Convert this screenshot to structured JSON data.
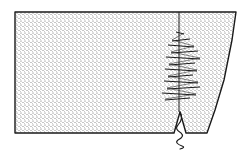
{
  "figure": {
    "description": "Stippled fabric piece with a vertical seam joined by hand zigzag/overcast stitches; a loose thread tail hangs from a notch at the bottom edge",
    "colors": {
      "background": "#ffffff",
      "ink": "#1a1a1a",
      "stipple": "#555555"
    },
    "fabric": {
      "outline": [
        [
          15,
          12
        ],
        [
          236,
          12
        ],
        [
          232,
          40
        ],
        [
          224,
          80
        ],
        [
          215,
          110
        ],
        [
          207,
          133
        ],
        [
          186,
          133
        ],
        [
          180,
          112
        ],
        [
          174,
          133
        ],
        [
          15,
          133
        ]
      ]
    },
    "seam": {
      "x": 179,
      "top": 12,
      "bottom": 112
    },
    "stitches": [
      {
        "y": 33,
        "left": 176,
        "right": 184
      },
      {
        "y": 40,
        "left": 172,
        "right": 190
      },
      {
        "y": 46,
        "left": 168,
        "right": 194
      },
      {
        "y": 52,
        "left": 171,
        "right": 198
      },
      {
        "y": 58,
        "left": 166,
        "right": 200
      },
      {
        "y": 64,
        "left": 169,
        "right": 195
      },
      {
        "y": 70,
        "left": 165,
        "right": 197
      },
      {
        "y": 76,
        "left": 168,
        "right": 193
      },
      {
        "y": 82,
        "left": 164,
        "right": 198
      },
      {
        "y": 88,
        "left": 167,
        "right": 200
      },
      {
        "y": 94,
        "left": 162,
        "right": 196
      },
      {
        "y": 99,
        "left": 165,
        "right": 190
      }
    ],
    "thread_tail": [
      [
        180,
        112
      ],
      [
        178,
        125
      ],
      [
        181,
        133
      ],
      [
        178,
        140
      ],
      [
        182,
        146
      ],
      [
        180,
        149
      ]
    ]
  }
}
